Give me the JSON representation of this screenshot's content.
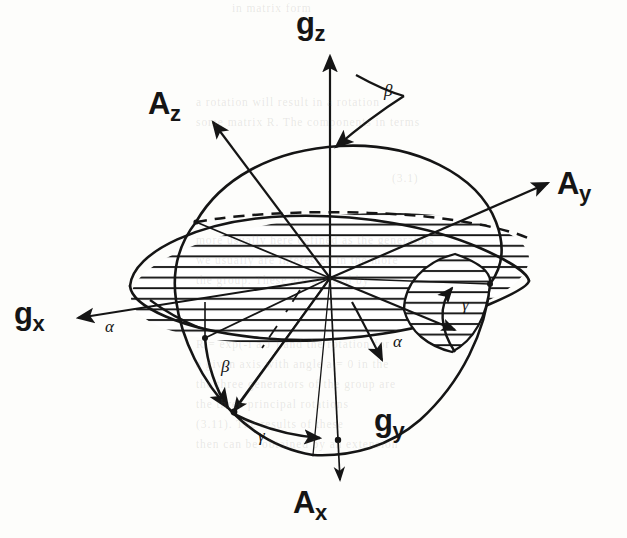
{
  "figure": {
    "background_color": "#fdfdfb",
    "ink_color": "#151515"
  },
  "axis_labels": [
    {
      "id": "gz",
      "base": "g",
      "sub": "z",
      "x": 296,
      "y": 8,
      "name": "axis-label-gz"
    },
    {
      "id": "Az",
      "base": "A",
      "sub": "z",
      "x": 148,
      "y": 88,
      "name": "axis-label-az"
    },
    {
      "id": "Ay",
      "base": "A",
      "sub": "y",
      "x": 557,
      "y": 168,
      "name": "axis-label-ay"
    },
    {
      "id": "gx",
      "base": "g",
      "sub": "x",
      "x": 14,
      "y": 298,
      "name": "axis-label-gx"
    },
    {
      "id": "gy",
      "base": "g",
      "sub": "y",
      "x": 374,
      "y": 405,
      "name": "axis-label-gy"
    },
    {
      "id": "Ax",
      "base": "A",
      "sub": "x",
      "x": 293,
      "y": 487,
      "name": "axis-label-ax"
    }
  ],
  "angle_labels": [
    {
      "id": "beta-top",
      "glyph": "β",
      "x": 384,
      "y": 82,
      "name": "angle-label-beta-top"
    },
    {
      "id": "gamma-right",
      "glyph": "γ",
      "x": 462,
      "y": 296,
      "name": "angle-label-gamma-right"
    },
    {
      "id": "alpha-left",
      "glyph": "α",
      "x": 105,
      "y": 318,
      "name": "angle-label-alpha-left"
    },
    {
      "id": "alpha-center",
      "glyph": "α",
      "x": 393,
      "y": 333,
      "name": "angle-label-alpha-center"
    },
    {
      "id": "beta-lower",
      "glyph": "β",
      "x": 221,
      "y": 358,
      "name": "angle-label-beta-lower"
    },
    {
      "id": "gamma-lower",
      "glyph": "γ",
      "x": 258,
      "y": 427,
      "name": "angle-label-gamma-lower"
    }
  ],
  "geometry": {
    "origin": {
      "x": 330,
      "y": 278
    },
    "horizontal_ellipse": {
      "cx": 330,
      "cy": 278,
      "rx": 200,
      "ry": 62,
      "rotation": -6,
      "hatched": true
    },
    "tilted_circle": {
      "cx": 335,
      "cy": 300,
      "r": 165,
      "description": "great circle through origin, tilted"
    },
    "hatch_spacing_px": 11,
    "dashed_arc": "hidden rear edge of horizontal ellipse"
  },
  "bleed_through_text": [
    {
      "text": "in matrix form",
      "x": 232,
      "y": 2
    },
    {
      "text": "a rotation will result in a rotation",
      "x": 196,
      "y": 96
    },
    {
      "text": "some matrix R. The components in terms",
      "x": 196,
      "y": 116
    },
    {
      "text": "(3.1)",
      "x": 392,
      "y": 172
    },
    {
      "text": "more usually here defined as the generators",
      "x": 196,
      "y": 234
    },
    {
      "text": "we usually are interested in the more",
      "x": 196,
      "y": 254
    },
    {
      "text": "the group. These are defined by",
      "x": 196,
      "y": 274
    },
    {
      "text": "R = exp(-i a J ) and the rotation for",
      "x": 196,
      "y": 338
    },
    {
      "text": "a given axis with angle a = 0 in the",
      "x": 196,
      "y": 358
    },
    {
      "text": "the three generators of the group are",
      "x": 196,
      "y": 378
    },
    {
      "text": "the three principal rotations",
      "x": 196,
      "y": 398
    },
    {
      "text": "(3.11). The results of these",
      "x": 196,
      "y": 418
    },
    {
      "text": "then can be obtained by an extension",
      "x": 196,
      "y": 438
    }
  ]
}
